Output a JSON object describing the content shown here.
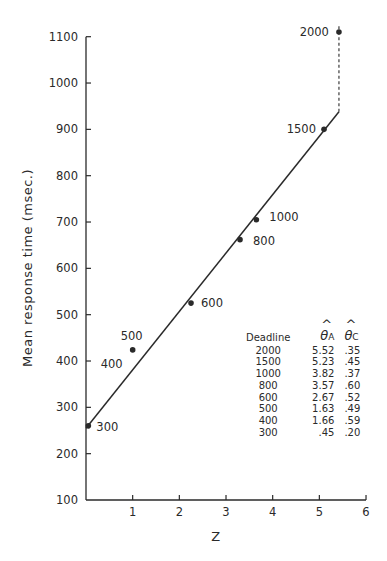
{
  "chart_data": {
    "type": "scatter",
    "title": "",
    "xlabel": "Z",
    "ylabel": "Mean response time (msec.)",
    "xlim": [
      0,
      6
    ],
    "ylim": [
      100,
      1100
    ],
    "x_ticks": [
      1,
      2,
      3,
      4,
      5,
      6
    ],
    "y_ticks": [
      100,
      200,
      300,
      400,
      500,
      600,
      700,
      800,
      900,
      1000,
      1100
    ],
    "grid": false,
    "series": [
      {
        "name": "Deadline conditions",
        "points": [
          {
            "label": "300",
            "x": 0.05,
            "y": 260
          },
          {
            "label": "400",
            "x": 1.0,
            "y": 420
          },
          {
            "label": "500",
            "x": 1.0,
            "y": 424
          },
          {
            "label": "600",
            "x": 2.25,
            "y": 525
          },
          {
            "label": "800",
            "x": 3.3,
            "y": 662
          },
          {
            "label": "1000",
            "x": 3.65,
            "y": 705
          },
          {
            "label": "1500",
            "x": 5.1,
            "y": 900
          },
          {
            "label": "2000",
            "x": 5.42,
            "y": 1110
          }
        ]
      }
    ],
    "fit_line": {
      "style": "solid",
      "from": {
        "x": 0.0,
        "y": 255
      },
      "to": {
        "x": 5.42,
        "y": 938
      }
    },
    "asymptote": {
      "style": "dashed",
      "x": 5.42,
      "from_y": 938,
      "to_y": 1125
    },
    "table": {
      "headers": [
        "Deadline",
        "θ̂A",
        "θ̂C"
      ],
      "rows": [
        [
          "2000",
          "5.52",
          ".35"
        ],
        [
          "1500",
          "5.23",
          ".45"
        ],
        [
          "1000",
          "3.82",
          ".37"
        ],
        [
          "800",
          "3.57",
          ".60"
        ],
        [
          "600",
          "2.67",
          ".52"
        ],
        [
          "500",
          "1.63",
          ".49"
        ],
        [
          "400",
          "1.66",
          ".59"
        ],
        [
          "300",
          ".45",
          ".20"
        ]
      ]
    }
  },
  "axes": {
    "x_title": "Z",
    "y_title": "Mean response time (msec.)",
    "x_tick_labels": [
      "1",
      "2",
      "3",
      "4",
      "5",
      "6"
    ],
    "y_tick_labels": [
      "100",
      "200",
      "300",
      "400",
      "500",
      "600",
      "700",
      "800",
      "900",
      "1000",
      "1100"
    ]
  },
  "table": {
    "header_deadline": "Deadline",
    "header_a_symbol": "θ",
    "header_a_sub": "A",
    "header_c_symbol": "θ",
    "header_c_sub": "C",
    "rows": [
      {
        "deadline": "2000",
        "theta_a": "5.52",
        "theta_c": ".35"
      },
      {
        "deadline": "1500",
        "theta_a": "5.23",
        "theta_c": ".45"
      },
      {
        "deadline": "1000",
        "theta_a": "3.82",
        "theta_c": ".37"
      },
      {
        "deadline": "800",
        "theta_a": "3.57",
        "theta_c": ".60"
      },
      {
        "deadline": "600",
        "theta_a": "2.67",
        "theta_c": ".52"
      },
      {
        "deadline": "500",
        "theta_a": "1.63",
        "theta_c": ".49"
      },
      {
        "deadline": "400",
        "theta_a": "1.66",
        "theta_c": ".59"
      },
      {
        "deadline": "300",
        "theta_a": ".45",
        "theta_c": ".20"
      }
    ]
  },
  "colors": {
    "ink": "#2a2a2a",
    "background": "#ffffff"
  }
}
